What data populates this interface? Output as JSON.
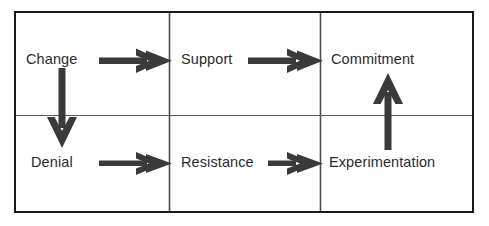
{
  "diagram": {
    "colors": {
      "outer_border": "#1a1a1a",
      "inner_grid": "#4d4d4d",
      "arrow": "#3a3a3a",
      "text": "#2b2b2b",
      "background": "#ffffff"
    },
    "grid": {
      "rows": 2,
      "columns": 3,
      "outer_border_width_px": 2,
      "inner_line_width_px": 1
    },
    "cells": [
      {
        "id": "change",
        "label": "Change",
        "row": 1,
        "column": 1
      },
      {
        "id": "support",
        "label": "Support",
        "row": 1,
        "column": 2
      },
      {
        "id": "commitment",
        "label": "Commitment",
        "row": 1,
        "column": 3
      },
      {
        "id": "denial",
        "label": "Denial",
        "row": 2,
        "column": 1
      },
      {
        "id": "resistance",
        "label": "Resistance",
        "row": 2,
        "column": 2
      },
      {
        "id": "experimentation",
        "label": "Experimentation",
        "row": 2,
        "column": 3
      }
    ],
    "arrows": [
      {
        "id": "change-to-support",
        "from": "change",
        "to": "support",
        "direction": "right"
      },
      {
        "id": "support-to-commitment",
        "from": "support",
        "to": "commitment",
        "direction": "right"
      },
      {
        "id": "change-to-denial",
        "from": "change",
        "to": "denial",
        "direction": "down"
      },
      {
        "id": "denial-to-resistance",
        "from": "denial",
        "to": "resistance",
        "direction": "right"
      },
      {
        "id": "resistance-to-experimentation",
        "from": "resistance",
        "to": "experimentation",
        "direction": "right"
      },
      {
        "id": "experimentation-to-commitment",
        "from": "experimentation",
        "to": "commitment",
        "direction": "up"
      }
    ]
  }
}
